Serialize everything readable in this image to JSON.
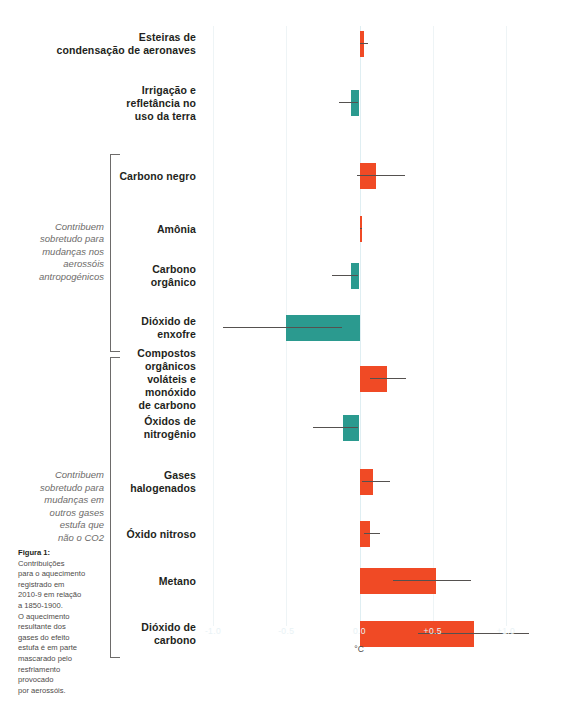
{
  "chart_data": {
    "type": "bar",
    "orientation": "horizontal",
    "title": "",
    "xlabel": "°C",
    "ylabel": "",
    "xlim": [
      -1.0,
      1.0
    ],
    "grid": true,
    "legend": "none",
    "xticks": [
      {
        "value": -1.0,
        "label": "-1.0"
      },
      {
        "value": -0.5,
        "label": "-0.5"
      },
      {
        "value": 0.0,
        "label": "0.0"
      },
      {
        "value": 0.5,
        "label": "+0.5"
      },
      {
        "value": 1.0,
        "label": "+1.0"
      }
    ],
    "colors": {
      "positive": "#f04a25",
      "negative": "#2b9a8f",
      "error_bar": "#55514f",
      "gridline": "#eef4f6",
      "zero_line": "#dfeef2"
    },
    "categories": [
      {
        "label": "Esteiras de\ncondensação de aeronaves",
        "label_lines": [
          "Esteiras de",
          "condensação de aeronaves"
        ],
        "value": 0.03,
        "ci_low": 0.0,
        "ci_high": 0.06
      },
      {
        "label": "Irrigação e\nrefletância no\nuso da terra",
        "label_lines": [
          "Irrigação e",
          "refletância no",
          "uso da terra"
        ],
        "value": -0.06,
        "ci_low": -0.14,
        "ci_high": -0.01
      },
      {
        "label": "Carbono negro",
        "label_lines": [
          "Carbono negro"
        ],
        "value": 0.11,
        "ci_low": -0.02,
        "ci_high": 0.31
      },
      {
        "label": "Amônia",
        "label_lines": [
          "Amônia"
        ],
        "value": 0.01,
        "ci_low": 0.0,
        "ci_high": 0.02
      },
      {
        "label": "Carbono\norgânico",
        "label_lines": [
          "Carbono",
          "orgânico"
        ],
        "value": -0.06,
        "ci_low": -0.19,
        "ci_high": -0.01
      },
      {
        "label": "Dióxido de\nenxofre",
        "label_lines": [
          "Dióxido de",
          "enxofre"
        ],
        "value": -0.5,
        "ci_low": -0.93,
        "ci_high": -0.12
      },
      {
        "label": "Compostos\norgânicos\nvoláteis e\nmonóxido\nde carbono",
        "label_lines": [
          "Compostos",
          "orgânicos",
          "voláteis e",
          "monóxido",
          "de carbono"
        ],
        "value": 0.19,
        "ci_low": 0.07,
        "ci_high": 0.32
      },
      {
        "label": "Óxidos de\nnitrogênio",
        "label_lines": [
          "Óxidos de",
          "nitrogênio"
        ],
        "value": -0.11,
        "ci_low": -0.32,
        "ci_high": -0.01
      },
      {
        "label": "Gases\nhalogenados",
        "label_lines": [
          "Gases",
          "halogenados"
        ],
        "value": 0.09,
        "ci_low": 0.02,
        "ci_high": 0.21
      },
      {
        "label": "Óxido nitroso",
        "label_lines": [
          "Óxido nitroso"
        ],
        "value": 0.07,
        "ci_low": 0.03,
        "ci_high": 0.14
      },
      {
        "label": "Metano",
        "label_lines": [
          "Metano"
        ],
        "value": 0.52,
        "ci_low": 0.23,
        "ci_high": 0.76
      },
      {
        "label": "Dióxido de\ncarbono",
        "label_lines": [
          "Dióxido de",
          "carbono"
        ],
        "value": 0.78,
        "ci_low": 0.4,
        "ci_high": 1.16
      }
    ],
    "groups": [
      {
        "note": "Contribuem\nsobretudo para\nmudanças nos\naerossóis\nantropogénicos",
        "note_lines": [
          "Contribuem",
          "sobretudo para",
          "mudanças nos",
          "aerossóis",
          "antropogénicos"
        ],
        "from_index": 2,
        "to_index": 5
      },
      {
        "note": "Contribuem\nsobretudo para\nmudanças em\noutros gases\nestufa que\nnão o CO2",
        "note_lines": [
          "Contribuem",
          "sobretudo para",
          "mudanças em",
          "outros gases",
          "estufa que",
          "não o CO2"
        ],
        "from_index": 6,
        "to_index": 11
      }
    ]
  },
  "caption": {
    "title": "Figura 1:",
    "body_lines": [
      "Contribuições",
      "para o aquecimento",
      "registrado em",
      "2010-9 em relação",
      "a 1850-1900.",
      "O aquecimento",
      "resultante dos",
      "gases do efeito",
      "estufa é em parte",
      "mascarado pelo",
      "resfriamento",
      "provocado",
      "por aerossóis."
    ]
  }
}
